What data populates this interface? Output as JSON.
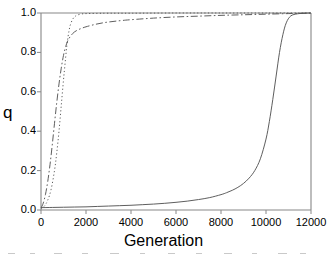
{
  "chart_data": {
    "type": "line",
    "title": "",
    "xlabel": "Generation",
    "ylabel": "q",
    "xlim": [
      0,
      12000
    ],
    "ylim": [
      0.0,
      1.0
    ],
    "xticks": [
      0,
      2000,
      4000,
      6000,
      8000,
      10000,
      12000
    ],
    "xtick_labels": [
      "0",
      "2000",
      "4000",
      "6000",
      "8000",
      "10000",
      "12000"
    ],
    "yticks": [
      0.0,
      0.2,
      0.4,
      0.6,
      0.8,
      1.0
    ],
    "ytick_labels": [
      "0.0",
      "0.2",
      "0.4",
      "0.6",
      "0.8",
      "1.0"
    ],
    "grid": false,
    "legend": "none",
    "line_color": "#555555",
    "axis_color": "#888888",
    "background": "#ffffff",
    "series": [
      {
        "name": "solid-slow-sweep",
        "style": "solid",
        "x": [
          0,
          500,
          1000,
          1500,
          2000,
          2500,
          3000,
          3500,
          4000,
          4500,
          5000,
          5500,
          6000,
          6500,
          7000,
          7500,
          8000,
          8250,
          8500,
          8750,
          9000,
          9250,
          9500,
          9750,
          10000,
          10150,
          10300,
          10450,
          10600,
          10750,
          10900,
          11100,
          11400,
          11700,
          12000
        ],
        "y": [
          0.012,
          0.013,
          0.014,
          0.015,
          0.016,
          0.018,
          0.02,
          0.022,
          0.024,
          0.027,
          0.03,
          0.034,
          0.039,
          0.045,
          0.053,
          0.063,
          0.078,
          0.088,
          0.1,
          0.115,
          0.135,
          0.162,
          0.2,
          0.26,
          0.36,
          0.45,
          0.56,
          0.68,
          0.8,
          0.89,
          0.95,
          0.985,
          0.996,
          0.999,
          1.0
        ]
      },
      {
        "name": "dash-dot-fast-rise",
        "style": "dash-dot",
        "x": [
          0,
          100,
          200,
          300,
          400,
          500,
          600,
          700,
          800,
          900,
          1000,
          1100,
          1200,
          1400,
          1600,
          1800,
          2000,
          2400,
          2800,
          3200,
          3600,
          4000,
          5000,
          6000,
          7000,
          8000,
          9000,
          10000,
          11000,
          12000
        ],
        "y": [
          0.01,
          0.035,
          0.08,
          0.145,
          0.23,
          0.33,
          0.44,
          0.545,
          0.64,
          0.72,
          0.785,
          0.83,
          0.862,
          0.895,
          0.912,
          0.922,
          0.93,
          0.942,
          0.951,
          0.957,
          0.962,
          0.966,
          0.974,
          0.98,
          0.984,
          0.988,
          0.991,
          0.994,
          0.997,
          0.999
        ]
      },
      {
        "name": "dotted-fast-rise",
        "style": "dotted",
        "x": [
          0,
          150,
          300,
          450,
          600,
          700,
          800,
          900,
          1000,
          1050,
          1100,
          1150,
          1200,
          1250,
          1300,
          1400,
          1500,
          1600,
          1800,
          2000,
          2400,
          3000,
          4000,
          6000,
          8000,
          10000,
          12000
        ],
        "y": [
          0.008,
          0.02,
          0.05,
          0.105,
          0.2,
          0.29,
          0.4,
          0.53,
          0.66,
          0.72,
          0.78,
          0.835,
          0.878,
          0.912,
          0.938,
          0.967,
          0.981,
          0.989,
          0.995,
          0.997,
          0.998,
          0.999,
          0.999,
          1.0,
          1.0,
          1.0,
          1.0
        ]
      }
    ]
  },
  "axes": {
    "ylabel": "q",
    "xlabel": "Generation"
  }
}
